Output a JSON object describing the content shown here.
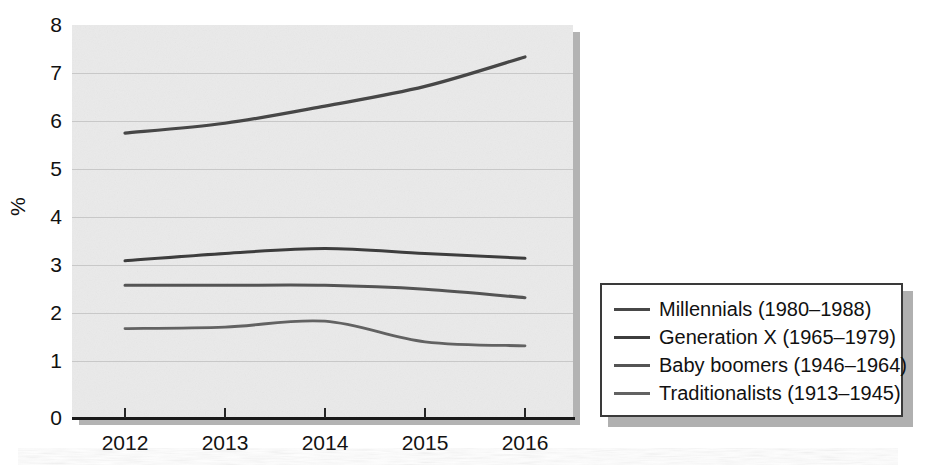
{
  "chart_data": {
    "type": "line",
    "title": "",
    "subtitle": "",
    "xlabel": "",
    "ylabel": "%",
    "categories": [
      "2012",
      "2013",
      "2014",
      "2015",
      "2016"
    ],
    "x": [
      2012,
      2013,
      2014,
      2015,
      2016
    ],
    "xlim": [
      2012,
      2016
    ],
    "ylim": [
      0,
      8
    ],
    "yticks": [
      "0",
      "1",
      "2",
      "3",
      "4",
      "5",
      "6",
      "7",
      "8"
    ],
    "grid": "horizontal",
    "legend_position": "right",
    "background": "#eaeaea",
    "series": [
      {
        "name": "Millennials (1980–1988)",
        "values": [
          5.8,
          6.0,
          6.35,
          6.75,
          7.35
        ],
        "color": "#474747"
      },
      {
        "name": "Generation X (1965–1979)",
        "values": [
          3.2,
          3.35,
          3.45,
          3.35,
          3.25
        ],
        "color": "#3d3d3d"
      },
      {
        "name": "Baby boomers (1946–1964)",
        "values": [
          2.7,
          2.7,
          2.7,
          2.62,
          2.45
        ],
        "color": "#545454"
      },
      {
        "name": "Traditionalists (1913–1945)",
        "values": [
          1.82,
          1.85,
          1.97,
          1.55,
          1.47
        ],
        "color": "#626262"
      }
    ]
  },
  "axes": {
    "y_axis_label": "%",
    "y_tick_labels": [
      "8",
      "7",
      "6",
      "5",
      "4",
      "3",
      "2",
      "1",
      "0"
    ],
    "x_tick_labels": [
      "2012",
      "2013",
      "2014",
      "2015",
      "2016"
    ]
  },
  "legend": {
    "items": [
      {
        "label": "Millennials (1980–1988)",
        "swatch": "#474747"
      },
      {
        "label": "Generation X (1965–1979)",
        "swatch": "#3d3d3d"
      },
      {
        "label": "Baby boomers (1946–1964)",
        "swatch": "#545454"
      },
      {
        "label": "Traditionalists (1913–1945)",
        "swatch": "#626262"
      }
    ]
  },
  "colors": {
    "plot_background": "#eaeaea",
    "gridline": "#c8c8c8",
    "axis": "#1a1a1a",
    "text": "#111111",
    "legend_border": "#3a3a3a",
    "shadow": "#b3b3b3"
  }
}
